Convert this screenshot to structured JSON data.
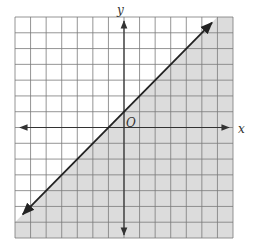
{
  "chart_data": {
    "type": "line",
    "title": "",
    "xlabel": "x",
    "ylabel": "y",
    "origin_label": "O",
    "xlim": [
      -7,
      7
    ],
    "ylim": [
      -7,
      7
    ],
    "grid": true,
    "grid_step": 1,
    "tick_labels": false,
    "series": [
      {
        "name": "boundary line",
        "equation": "y = x + 1",
        "slope": 1,
        "intercept": 1,
        "line_style": "solid",
        "arrows_both_ends": true,
        "x": [
          -6.5,
          5.65
        ],
        "y": [
          -5.5,
          6.65
        ]
      }
    ],
    "shaded_region": {
      "inequality": "y <= x + 1",
      "side": "below-right of line",
      "color": "#dcdcdc"
    },
    "legend": null
  },
  "colors": {
    "background": "#ffffff",
    "grid": "#7a7a7a",
    "axis": "#333333",
    "line": "#222222",
    "shade": "#dcdcdc"
  }
}
